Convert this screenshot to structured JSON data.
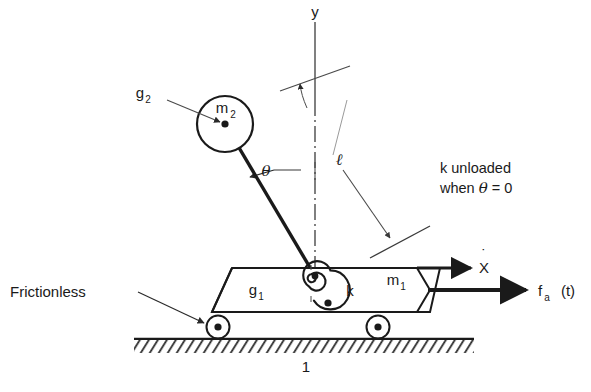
{
  "figure": {
    "figure_number": "1",
    "domain_type": "mechanical-schematic"
  },
  "labels": {
    "y_axis": "y",
    "mass_pendulum": "m",
    "mass_pendulum_sub": "2",
    "mass_cart": "m",
    "mass_cart_sub": "1",
    "cg_pendulum": "g",
    "cg_pendulum_sub": "2",
    "cg_cart": "g",
    "cg_cart_sub": "1",
    "theta": "θ",
    "length": "ℓ",
    "spring": "k",
    "velocity": "X",
    "velocity_dot": "˙",
    "force": "f",
    "force_sub": "a",
    "force_arg": "(t)",
    "frictionless": "Frictionless",
    "ground_number": "1"
  },
  "note": {
    "line1": "k unloaded",
    "line2_prefix": "when ",
    "line2_theta": "θ",
    "line2_suffix": " = 0"
  },
  "colors": {
    "ink": "#1a1a1a",
    "leader": "#4a4a4a",
    "background": "#ffffff",
    "hatch": "#2a2a2a"
  },
  "geometry": {
    "pivot_x": 315,
    "pivot_y": 276,
    "mass2_center_x": 225,
    "mass2_center_y": 124,
    "mass2_radius": 28,
    "ground_y": 340,
    "cart_top_y": 268,
    "cart_bottom_y": 312,
    "wheel_radius": 11
  },
  "elements": [
    {
      "name": "pendulum-mass-m2",
      "kind": "circle-mass"
    },
    {
      "name": "pendulum-rod",
      "kind": "rod"
    },
    {
      "name": "torsional-spring-k",
      "kind": "spiral-spring"
    },
    {
      "name": "cart-body-m1",
      "kind": "trapezoid"
    },
    {
      "name": "wheel-left",
      "kind": "wheel"
    },
    {
      "name": "wheel-right",
      "kind": "wheel"
    },
    {
      "name": "ground-hatching",
      "kind": "hatched-surface"
    },
    {
      "name": "velocity-arrow-xdot",
      "kind": "arrow"
    },
    {
      "name": "force-arrow-fa",
      "kind": "arrow"
    },
    {
      "name": "theta-angle-arc",
      "kind": "arc-arrow"
    },
    {
      "name": "length-leader-l",
      "kind": "leader-arrow"
    },
    {
      "name": "y-axis-centerline",
      "kind": "dash-dot-line"
    }
  ]
}
